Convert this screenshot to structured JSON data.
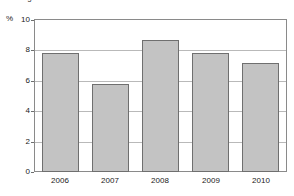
{
  "chart_data": {
    "type": "bar",
    "title": "Real growth in GDP",
    "subtitle": "",
    "xlabel": "",
    "ylabel": "%",
    "categories": [
      "2006",
      "2007",
      "2008",
      "2009",
      "2010"
    ],
    "values": [
      7.8,
      5.8,
      8.7,
      7.8,
      7.2
    ],
    "series": [
      {
        "name": "Real growth in GDP",
        "values": [
          7.8,
          5.8,
          8.7,
          7.8,
          7.2
        ]
      }
    ],
    "ylim": [
      0,
      10
    ],
    "yticks": [
      0,
      2,
      4,
      6,
      8,
      10
    ],
    "ytick_labels": [
      "0",
      "2",
      "4",
      "6",
      "8",
      "10"
    ],
    "xtick_labels": [
      "2006",
      "2007",
      "2008",
      "2009",
      "2010"
    ],
    "grid": true,
    "grid_axis": "y",
    "legend": false,
    "legend_position": "none",
    "bar_fill_color": "#c3c3c3",
    "bar_border_color": "#6f6f6f",
    "grid_color": "#b9b9b9",
    "frame_color": "#8a8a8a",
    "background_color": "#ffffff",
    "text_color": "#222222"
  }
}
